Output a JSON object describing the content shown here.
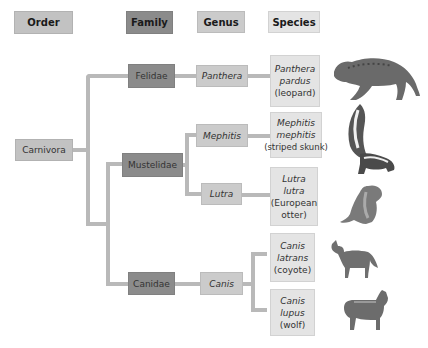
{
  "headers": {
    "order": "Order",
    "family": "Family",
    "genus": "Genus",
    "species": "Species"
  },
  "order": {
    "name": "Carnivora"
  },
  "families": [
    {
      "name": "Felidae"
    },
    {
      "name": "Mustelidae"
    },
    {
      "name": "Canidae"
    }
  ],
  "genera": [
    {
      "name": "Panthera",
      "family": "Felidae"
    },
    {
      "name": "Mephitis",
      "family": "Mustelidae"
    },
    {
      "name": "Lutra",
      "family": "Mustelidae"
    },
    {
      "name": "Canis",
      "family": "Canidae"
    }
  ],
  "species": [
    {
      "latin1": "Panthera",
      "latin2": "pardus",
      "common": "(leopard)",
      "image": "leopard-image"
    },
    {
      "latin1": "Mephitis",
      "latin2": "mephitis",
      "common": "(striped skunk)",
      "image": "skunk-image"
    },
    {
      "latin1": "Lutra",
      "latin2": "lutra",
      "common": "(European",
      "common2": "otter)",
      "image": "otter-image"
    },
    {
      "latin1": "Canis",
      "latin2": "latrans",
      "common": "(coyote)",
      "image": "coyote-image"
    },
    {
      "latin1": "Canis",
      "latin2": "lupus",
      "common": "(wolf)",
      "image": "wolf-image"
    }
  ],
  "colors": {
    "order": "#c2c2c2",
    "family": "#8b8b8b",
    "genus": "#cbcbcb",
    "species": "#e4e4e4",
    "connector": "#b9b9b9"
  }
}
